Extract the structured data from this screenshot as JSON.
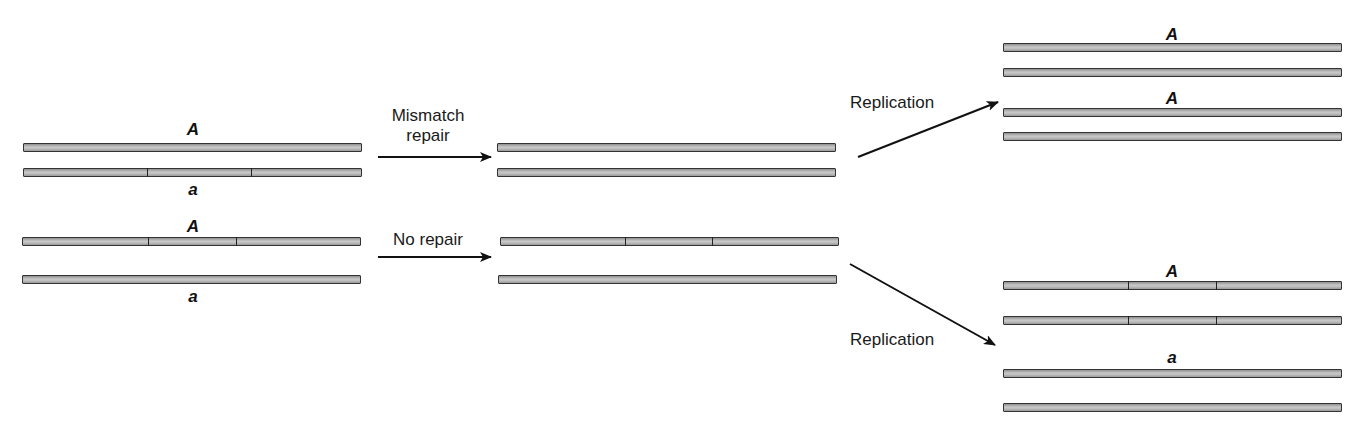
{
  "diagram": {
    "type": "mismatch-repair-vs-no-repair",
    "colors": {
      "strand_fill": "#bdbdbd",
      "strand_border": "#333333",
      "arrow": "#111111",
      "text": "#111111"
    },
    "left": {
      "top_pair": {
        "upper_label": "A",
        "lower_label": "a"
      },
      "bottom_pair": {
        "upper_label": "A",
        "lower_label": "a"
      }
    },
    "arrows": {
      "mismatch_repair": {
        "line1": "Mismatch",
        "line2": "repair"
      },
      "no_repair": {
        "label": "No repair"
      },
      "replication_top": {
        "label": "Replication"
      },
      "replication_bottom": {
        "label": "Replication"
      }
    },
    "right": {
      "top_group": {
        "pair1_label": "A",
        "pair2_label": "A"
      },
      "bottom_group": {
        "pair1_label": "A",
        "pair2_label": "a"
      }
    }
  }
}
